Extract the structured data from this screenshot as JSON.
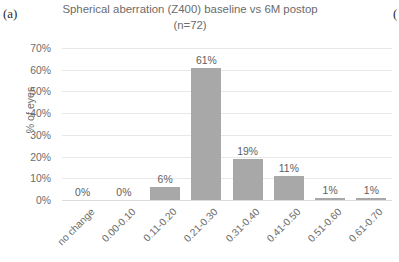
{
  "panel": {
    "label": "(a)",
    "right_label_partial": "("
  },
  "chart_data": {
    "type": "bar",
    "title": "Spherical aberration (Z400) baseline vs 6M postop (n=72)",
    "xlabel": "",
    "ylabel": "% of eyes",
    "categories": [
      "no change",
      "0.00-0.10",
      "0.11-0.20",
      "0.21-0.30",
      "0.31-0.40",
      "0.41-0.50",
      "0.51-0.60",
      "0.61-0.70"
    ],
    "values": [
      0,
      0,
      6,
      61,
      19,
      11,
      1,
      1
    ],
    "data_labels": [
      "0%",
      "0%",
      "6%",
      "61%",
      "19%",
      "11%",
      "1%",
      "1%"
    ],
    "ylim": [
      0,
      70
    ],
    "yticks": [
      0,
      10,
      20,
      30,
      40,
      50,
      60,
      70
    ],
    "ytick_labels": [
      "0%",
      "10%",
      "20%",
      "30%",
      "40%",
      "50%",
      "60%",
      "70%"
    ],
    "grid": "horizontal",
    "legend": "none",
    "bar_color": "#a8a8a8",
    "text_color": "#6b6b6b",
    "gridline_color": "#e8e8e8"
  }
}
